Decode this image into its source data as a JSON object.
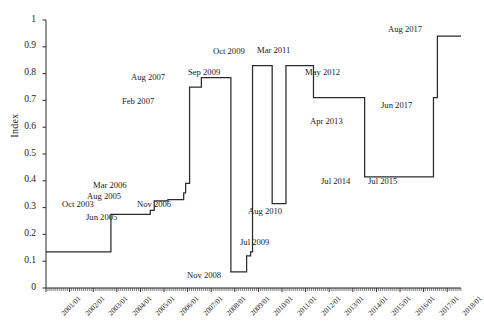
{
  "chart_data": {
    "type": "line",
    "title": "",
    "xlabel": "",
    "ylabel": "Index",
    "ylim": [
      0,
      1
    ],
    "ytick_labels": [
      "0",
      "0.1",
      "0.2",
      "0.3",
      "0.4",
      "0.5",
      "0.6",
      "0.7",
      "0.8",
      "0.9",
      "1"
    ],
    "ytick_values": [
      0,
      0.1,
      0.2,
      0.3,
      0.4,
      0.5,
      0.6,
      0.7,
      0.8,
      0.9,
      1
    ],
    "xtick_labels": [
      "2001/01",
      "2002/01",
      "2003/01",
      "2004/01",
      "2005/01",
      "2006/01",
      "2007/01",
      "2008/01",
      "2009/01",
      "2010/01",
      "2011/01",
      "2012/01",
      "2013/01",
      "2014/01",
      "2015/01",
      "2016/01",
      "2017/01",
      "2018/01"
    ],
    "xlim": [
      "2001/01",
      "2018/08"
    ],
    "grid": false,
    "legend": false,
    "line_style": "step",
    "line_color": "#2b2b2b",
    "steps": [
      {
        "date": "2001/01",
        "value": 0.135
      },
      {
        "date": "2003/10",
        "value": 0.275,
        "label": "Oct 2003"
      },
      {
        "date": "2005/06",
        "value": 0.29,
        "label": "Jun 2005"
      },
      {
        "date": "2005/08",
        "value": 0.325,
        "label": "Aug 2005"
      },
      {
        "date": "2006/03",
        "value": 0.33,
        "label": "Mar 2006"
      },
      {
        "date": "2006/11",
        "value": 0.355,
        "label": "Nov 2006"
      },
      {
        "date": "2006/12",
        "value": 0.39
      },
      {
        "date": "2007/02",
        "value": 0.75,
        "label": "Feb 2007"
      },
      {
        "date": "2007/08",
        "value": 0.785,
        "label": "Aug 2007"
      },
      {
        "date": "2008/11",
        "value": 0.06,
        "label": "Nov 2008"
      },
      {
        "date": "2009/07",
        "value": 0.12,
        "label": "Jul 2009"
      },
      {
        "date": "2009/09",
        "value": 0.135,
        "label": "Sep 2009"
      },
      {
        "date": "2009/10",
        "value": 0.83,
        "label": "Oct 2009"
      },
      {
        "date": "2010/08",
        "value": 0.315,
        "label": "Aug 2010"
      },
      {
        "date": "2011/03",
        "value": 0.83,
        "label": "Mar 2011"
      },
      {
        "date": "2012/05",
        "value": 0.71,
        "label": "May 2012"
      },
      {
        "date": "2013/04",
        "value": 0.71,
        "label": "Apr 2013"
      },
      {
        "date": "2014/07",
        "value": 0.415,
        "label": "Jul 2014"
      },
      {
        "date": "2015/07",
        "value": 0.415,
        "label": "Jul 2015"
      },
      {
        "date": "2017/06",
        "value": 0.71,
        "label": "Jun 2017"
      },
      {
        "date": "2017/08",
        "value": 0.94,
        "label": "Aug 2017"
      },
      {
        "date": "2018/08",
        "value": 0.94
      }
    ],
    "annotations": [
      {
        "text": "Oct 2003",
        "x": 62,
        "y": 199
      },
      {
        "text": "Jun 2005",
        "x": 86,
        "y": 212
      },
      {
        "text": "Aug 2005",
        "x": 87,
        "y": 191
      },
      {
        "text": "Mar 2006",
        "x": 93,
        "y": 180
      },
      {
        "text": "Nov 2006",
        "x": 137,
        "y": 199
      },
      {
        "text": "Feb  2007",
        "x": 122,
        "y": 96
      },
      {
        "text": "Aug 2007",
        "x": 131,
        "y": 72
      },
      {
        "text": "Nov 2008",
        "x": 187,
        "y": 270
      },
      {
        "text": "Jul 2009",
        "x": 240,
        "y": 237
      },
      {
        "text": "Sep 2009",
        "x": 188,
        "y": 67
      },
      {
        "text": "Oct 2009",
        "x": 213,
        "y": 46
      },
      {
        "text": "Aug 2010",
        "x": 248,
        "y": 206
      },
      {
        "text": "Mar 2011",
        "x": 257,
        "y": 45
      },
      {
        "text": "May 2012",
        "x": 305,
        "y": 67
      },
      {
        "text": "Apr 2013",
        "x": 310,
        "y": 116
      },
      {
        "text": "Jul 2014",
        "x": 321,
        "y": 176
      },
      {
        "text": "Jul 2015",
        "x": 368,
        "y": 176
      },
      {
        "text": "Jun 2017",
        "x": 381,
        "y": 100
      },
      {
        "text": "Aug 2017",
        "x": 388,
        "y": 24
      }
    ]
  }
}
